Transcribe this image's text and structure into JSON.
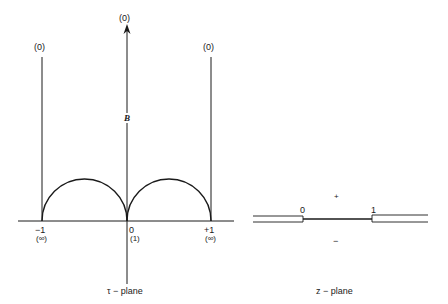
{
  "tau_plane": {
    "caption": "τ − plane",
    "top_labels": {
      "left": "(0)",
      "center": "(0)",
      "right": "(0)"
    },
    "region_label": "B",
    "axis_labels": {
      "left": {
        "value": "−1",
        "image": "(∞)"
      },
      "center": {
        "value": "0",
        "image": "(1)"
      },
      "right": {
        "value": "+1",
        "image": "(∞)"
      }
    }
  },
  "z_plane": {
    "caption": "z − plane",
    "points": {
      "left": "0",
      "right": "1"
    },
    "upper_side": "+",
    "lower_side": "−"
  }
}
